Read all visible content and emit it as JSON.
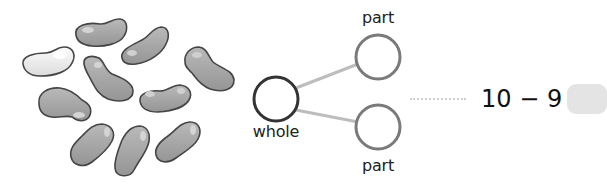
{
  "illustration": {
    "object": "bean",
    "total_count": 10,
    "highlighted_count": 1,
    "shaded_count": 9,
    "colors": {
      "highlighted_fill": "#f2f2f2",
      "shaded_fill": "#a9a9a9",
      "outline": "#444444"
    }
  },
  "part_whole": {
    "whole_label": "whole",
    "part_top_label": "part",
    "part_bottom_label": "part",
    "whole_value": "",
    "part_top_value": "",
    "part_bottom_value": "",
    "colors": {
      "whole_stroke": "#333333",
      "part_stroke": "#7a7a7a",
      "connector": "#bdbdbd"
    }
  },
  "equation": {
    "text": "10 − 9 =",
    "minuend": 10,
    "operator": "−",
    "subtrahend": 9,
    "answer": "",
    "answer_box_color": "#e4e4e4"
  }
}
